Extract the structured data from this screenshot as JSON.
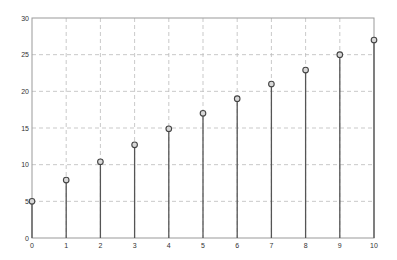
{
  "chart_data": {
    "type": "stem",
    "title": "",
    "xlabel": "",
    "ylabel": "",
    "x": [
      0,
      1,
      2,
      3,
      4,
      5,
      6,
      7,
      8,
      9,
      10
    ],
    "values": [
      5,
      7.9,
      10.4,
      12.7,
      14.9,
      17,
      19,
      21,
      22.9,
      25,
      27
    ],
    "xlim": [
      0,
      10
    ],
    "ylim": [
      0,
      30
    ],
    "xticks": [
      "0",
      "1",
      "2",
      "3",
      "4",
      "5",
      "6",
      "7",
      "8",
      "9",
      "10"
    ],
    "yticks": [
      "0",
      "5",
      "10",
      "15",
      "20",
      "25",
      "30"
    ],
    "grid": true,
    "grid_style": "dashed",
    "legend": null,
    "marker": "circle",
    "colors": {
      "stem": "#555555",
      "marker_edge": "#444444",
      "grid": "#bbbbbb",
      "axes": "#999999"
    }
  }
}
